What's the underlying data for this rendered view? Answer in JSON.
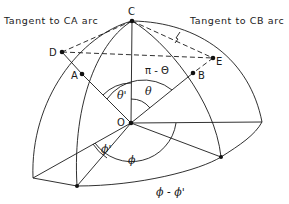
{
  "diagram": {
    "annotations": {
      "tangent_ca": "Tangent to CA arc",
      "tangent_cb": "Tangent to CB arc"
    },
    "points": {
      "C": "C",
      "D": "D",
      "A": "A",
      "E": "E",
      "B": "B",
      "O": "O"
    },
    "angles": {
      "pi_minus_theta": "π - Θ",
      "theta_prime": "θ'",
      "theta": "θ",
      "phi_prime": "ϕ'",
      "phi": "ϕ",
      "phi_minus_phi_prime": "ϕ - ϕ'"
    }
  }
}
